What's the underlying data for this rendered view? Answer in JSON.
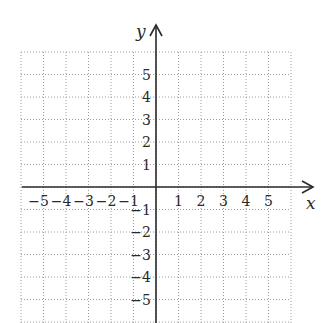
{
  "diagram": {
    "type": "coordinate-plane",
    "x_axis": {
      "label": "x",
      "ticks": [
        "-5",
        "-4",
        "-3",
        "-2",
        "-1",
        "1",
        "2",
        "3",
        "4",
        "5"
      ]
    },
    "y_axis": {
      "label": "y",
      "ticks": [
        "5",
        "4",
        "3",
        "2",
        "1",
        "-1",
        "-2",
        "-3",
        "-4",
        "-5"
      ]
    },
    "grid": {
      "style": "dotted",
      "color": "#9a9a9a",
      "x_range": [
        -6,
        6
      ],
      "y_range": [
        -6,
        6
      ]
    },
    "axis_color": "#2a2a2a"
  },
  "chart_data": {
    "type": "coordinate-grid",
    "title": "",
    "xlabel": "x",
    "ylabel": "y",
    "x_tick_labels": [
      "-5",
      "-4",
      "-3",
      "-2",
      "-1",
      "1",
      "2",
      "3",
      "4",
      "5"
    ],
    "y_tick_labels": [
      "-5",
      "-4",
      "-3",
      "-2",
      "-1",
      "1",
      "2",
      "3",
      "4",
      "5"
    ],
    "xlim": [
      -6,
      6
    ],
    "ylim": [
      -6,
      6
    ],
    "grid": true,
    "series": []
  }
}
